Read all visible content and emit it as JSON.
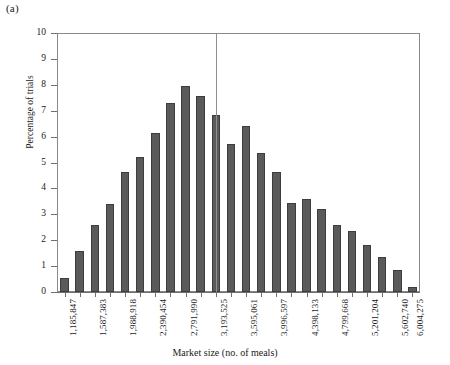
{
  "panel": {
    "label": "(a)"
  },
  "chart_data": {
    "type": "bar",
    "title": "",
    "subtitle": "",
    "xlabel": "Market size (no. of meals)",
    "ylabel": "Percentage of trials",
    "ylim": [
      0,
      10
    ],
    "ytick_labels": [
      "0",
      "1",
      "2",
      "3",
      "4",
      "5",
      "6",
      "7",
      "8",
      "9",
      "10"
    ],
    "ytick_values": [
      0,
      1,
      2,
      3,
      4,
      5,
      6,
      7,
      8,
      9,
      10
    ],
    "grid": false,
    "legend": null,
    "bar_color": "#5a5a5a",
    "bar_edge_color": "#3d3d3d",
    "axis_color": "#6e6e6e",
    "n_bars": 24,
    "categories": [
      "1,185,847",
      "1,386,615",
      "1,587,383",
      "1,788,151",
      "1,988,918",
      "2,189,686",
      "2,390,454",
      "2,591,222",
      "2,791,990",
      "2,992,758",
      "3,193,525",
      "3,394,293",
      "3,595,061",
      "3,795,829",
      "3,996,597",
      "4,197,365",
      "4,398,133",
      "4,598,901",
      "4,799,668",
      "5,000,436",
      "5,201,204",
      "5,401,972",
      "5,602,740",
      "6,004,275"
    ],
    "values": [
      0.55,
      1.6,
      2.6,
      3.4,
      4.65,
      5.2,
      6.15,
      7.3,
      7.95,
      7.55,
      6.85,
      5.7,
      6.4,
      5.35,
      4.65,
      3.45,
      3.6,
      3.2,
      2.6,
      2.35,
      1.8,
      1.35,
      0.85,
      0.2
    ],
    "xtick_labels": [
      "1,185,847",
      "1,587,383",
      "1,988,918",
      "2,390,454",
      "2,791,990",
      "3,193,525",
      "3,595,061",
      "3,996,597",
      "4,398,133",
      "4,799,668",
      "5,201,204",
      "5,602,740",
      "6,004,275"
    ],
    "xtick_label_indices": [
      0,
      2,
      4,
      6,
      8,
      10,
      12,
      14,
      16,
      18,
      20,
      22,
      23
    ],
    "annotations": [
      {
        "name": "reference-line",
        "type": "vline",
        "at_category": "3,193,525",
        "value": 3193525
      }
    ]
  }
}
